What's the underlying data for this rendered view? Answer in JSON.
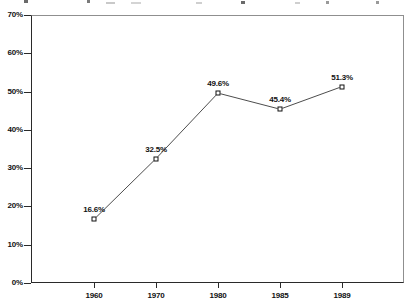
{
  "chart_data": {
    "type": "line",
    "categories": [
      "1960",
      "1970",
      "1980",
      "1985",
      "1989"
    ],
    "values": [
      16.6,
      32.5,
      49.6,
      45.4,
      51.3
    ],
    "point_labels": [
      "16.6%",
      "32.5%",
      "49.6%",
      "45.4%",
      "51.3%"
    ],
    "title": "",
    "xlabel": "",
    "ylabel": "",
    "ylim": [
      0,
      70
    ],
    "ytick_interval": 10,
    "ytick_labels": [
      "70%",
      "60%",
      "50%",
      "40%",
      "30%",
      "20%",
      "10%",
      "0%"
    ],
    "grid": false,
    "legend_position": "none",
    "marker": "open-square",
    "colors": {
      "line": "#4d4d4d",
      "marker_fill": "#ffffff",
      "marker_border": "#111111",
      "text": "#111111",
      "axis": "#2a2a2a",
      "frame": "#8f8f8f",
      "background": "#ffffff"
    }
  }
}
